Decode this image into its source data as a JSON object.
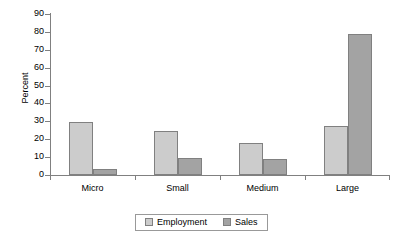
{
  "chart_data": {
    "type": "bar",
    "title": "",
    "subtitle": "",
    "xlabel": "",
    "ylabel": "Percent",
    "categories": [
      "Micro",
      "Small",
      "Medium",
      "Large"
    ],
    "series": [
      {
        "name": "Employment",
        "values": [
          29.5,
          24.5,
          18.0,
          27.5
        ],
        "color": "#cccccc"
      },
      {
        "name": "Sales",
        "values": [
          3.5,
          9.5,
          9.0,
          79.0
        ],
        "color": "#a3a3a3"
      }
    ],
    "ylim": [
      0,
      90
    ],
    "ytick_step": 10,
    "ytick_labels": [
      "0",
      "10",
      "20",
      "30",
      "40",
      "50",
      "60",
      "70",
      "80",
      "90"
    ],
    "grid": false,
    "legend_position": "bottom",
    "annotations": []
  },
  "axes": {
    "y_title": "Percent",
    "y_ticks": [
      {
        "label": "90",
        "value": 90
      },
      {
        "label": "80",
        "value": 80
      },
      {
        "label": "70",
        "value": 70
      },
      {
        "label": "60",
        "value": 60
      },
      {
        "label": "50",
        "value": 50
      },
      {
        "label": "40",
        "value": 40
      },
      {
        "label": "30",
        "value": 30
      },
      {
        "label": "20",
        "value": 20
      },
      {
        "label": "10",
        "value": 10
      },
      {
        "label": "0",
        "value": 0
      }
    ],
    "x_categories": [
      "Micro",
      "Small",
      "Medium",
      "Large"
    ]
  },
  "legend": {
    "entries": [
      {
        "label": "Employment",
        "swatch": "employment"
      },
      {
        "label": "Sales",
        "swatch": "sales"
      }
    ]
  },
  "colors": {
    "employment": "#cccccc",
    "sales": "#a3a3a3",
    "axis": "#808080",
    "text": "#000000",
    "background": "#ffffff"
  }
}
